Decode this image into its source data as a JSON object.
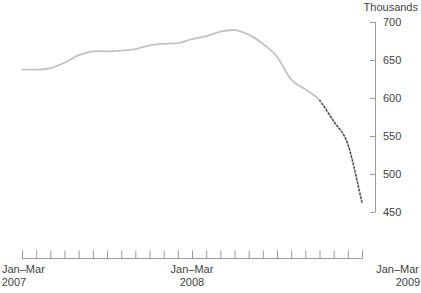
{
  "chart_data": {
    "type": "line",
    "title": "",
    "subtitle": "",
    "unit_label": "Thousands",
    "xlabel": "",
    "ylabel": "",
    "ylim": [
      440,
      700
    ],
    "y_ticks": [
      450,
      500,
      550,
      600,
      650,
      700
    ],
    "y_tick_labels": [
      "450",
      "500",
      "550",
      "600",
      "650",
      "700"
    ],
    "y_axis_position": "right",
    "grid": false,
    "legend": "none",
    "x_tick_count": 25,
    "x_major_labels": [
      {
        "label_line1": "Jan–Mar",
        "label_line2": "2007",
        "index": 0
      },
      {
        "label_line1": "Jan–Mar",
        "label_line2": "2008",
        "index": 12
      },
      {
        "label_line1": "Jan–Mar",
        "label_line2": "2009",
        "index": 24
      }
    ],
    "x": [
      "Jan-Mar 2007",
      "Feb-Apr 2007",
      "Mar-May 2007",
      "Apr-Jun 2007",
      "May-Jul 2007",
      "Jun-Aug 2007",
      "Jul-Sep 2007",
      "Aug-Oct 2007",
      "Sep-Nov 2007",
      "Oct-Dec 2007",
      "Nov-Jan 2008",
      "Dec-Feb 2008",
      "Jan-Mar 2008",
      "Feb-Apr 2008",
      "Mar-May 2008",
      "Apr-Jun 2008",
      "May-Jul 2008",
      "Jun-Aug 2008",
      "Jul-Sep 2008",
      "Aug-Oct 2008",
      "Sep-Nov 2008",
      "Oct-Dec 2008",
      "Nov-Jan 2009",
      "Dec-Feb 2009",
      "Jan-Mar 2009"
    ],
    "series": [
      {
        "name": "Series",
        "style": "solid",
        "color": "#c3c3c3",
        "values": [
          638,
          638,
          640,
          647,
          657,
          662,
          662,
          663,
          665,
          670,
          672,
          673,
          678,
          682,
          688,
          690,
          684,
          672,
          655,
          625,
          612,
          598,
          570,
          540,
          463
        ]
      }
    ],
    "forecast_segment": {
      "name": "Projection",
      "style": "dashed",
      "color": "#3d3d3d",
      "start_index": 21,
      "values": [
        598,
        570,
        540,
        463
      ]
    }
  },
  "footnote": {
    "text": ""
  }
}
